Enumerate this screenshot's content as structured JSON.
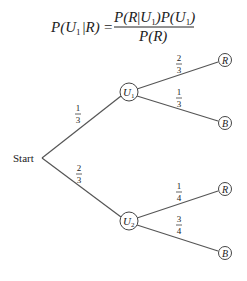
{
  "formula": {
    "lhs": "P(U₁ | R)",
    "lhs_parts": {
      "p": "P(",
      "u": "U",
      "sub": "1",
      "bar": "|",
      "r": "R)"
    },
    "equals": "=",
    "numerator": {
      "a": "P(R",
      "u": "U",
      "sub": "1",
      "b": ")P(",
      "u2": "U",
      "sub2": "1",
      "c": ")"
    },
    "denominator": "P(R)"
  },
  "tree": {
    "start_label": "Start",
    "branches": [
      {
        "node": {
          "letter": "U",
          "sub": "1"
        },
        "prob": {
          "num": "1",
          "den": "3"
        },
        "outcomes": [
          {
            "label": "R",
            "prob": {
              "num": "2",
              "den": "3"
            }
          },
          {
            "label": "B",
            "prob": {
              "num": "1",
              "den": "3"
            }
          }
        ]
      },
      {
        "node": {
          "letter": "U",
          "sub": "2"
        },
        "prob": {
          "num": "2",
          "den": "3"
        },
        "outcomes": [
          {
            "label": "R",
            "prob": {
              "num": "1",
              "den": "4"
            }
          },
          {
            "label": "B",
            "prob": {
              "num": "3",
              "den": "4"
            }
          }
        ]
      }
    ]
  }
}
